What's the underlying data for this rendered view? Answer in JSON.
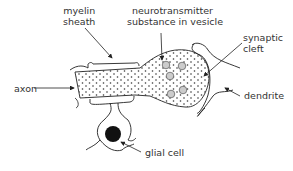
{
  "labels": {
    "myelin_line1": "myelin",
    "myelin_line2": "sheath",
    "neuro_line1": "neurotransmitter",
    "neuro_line2": "substance in vesicle",
    "synaptic_line1": "synaptic",
    "synaptic_line2": "cleft",
    "axon": "axon",
    "dendrite": "dendrite",
    "glial": "glial cell"
  }
}
